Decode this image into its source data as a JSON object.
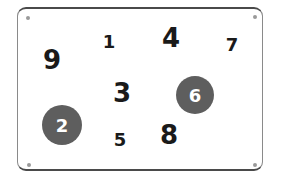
{
  "board": {
    "numbers": [
      {
        "value": "9",
        "x": 52,
        "y": 60,
        "size": "big",
        "marked": false
      },
      {
        "value": "1",
        "x": 109,
        "y": 42,
        "size": "small",
        "marked": false
      },
      {
        "value": "4",
        "x": 171,
        "y": 38,
        "size": "big",
        "marked": false
      },
      {
        "value": "7",
        "x": 232,
        "y": 45,
        "size": "small",
        "marked": false
      },
      {
        "value": "3",
        "x": 122,
        "y": 93,
        "size": "big",
        "marked": false
      },
      {
        "value": "6",
        "x": 195,
        "y": 95,
        "size": "small",
        "marked": true
      },
      {
        "value": "2",
        "x": 62,
        "y": 125,
        "size": "small",
        "marked": true
      },
      {
        "value": "5",
        "x": 120,
        "y": 140,
        "size": "small",
        "marked": false
      },
      {
        "value": "8",
        "x": 169,
        "y": 135,
        "size": "big",
        "marked": false
      }
    ],
    "colors": {
      "marked_fill": "#5e5e5e",
      "text": "#1a1a1a",
      "border": "#4a4a4a"
    }
  }
}
